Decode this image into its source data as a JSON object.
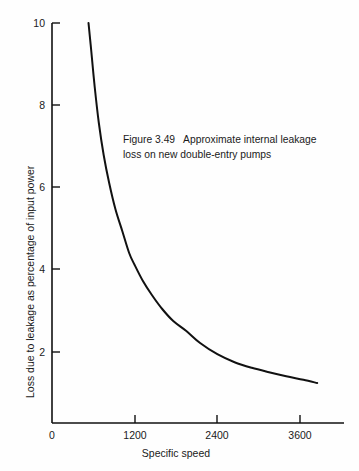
{
  "figure": {
    "caption_line1": "Figure 3.49   Approximate internal leakage",
    "caption_line2": "loss on new double-entry pumps",
    "background_color": "#fefefe",
    "ink_color": "#111111"
  },
  "chart_data": {
    "type": "line",
    "title": "Figure 3.49   Approximate internal leakage loss on new double-entry pumps",
    "xlabel": "Specific speed",
    "ylabel": "Loss due to leakage as percentage of input power",
    "xlim": [
      0,
      4000
    ],
    "ylim": [
      0,
      10
    ],
    "xticks": [
      0,
      1200,
      2400,
      3600
    ],
    "xtick_labels": [
      "0",
      "1200",
      "2400",
      "3600"
    ],
    "yticks": [
      2,
      4,
      6,
      8,
      10
    ],
    "ytick_labels": [
      "2",
      "4",
      "6",
      "8",
      "10"
    ],
    "grid": false,
    "legend": false,
    "series": [
      {
        "name": "Internal leakage loss",
        "color": "#111111",
        "line_width": 2.0,
        "x": [
          530,
          570,
          620,
          680,
          750,
          830,
          920,
          1020,
          1120,
          1200,
          1320,
          1450,
          1600,
          1760,
          1950,
          2150,
          2400,
          2650,
          2900,
          3150,
          3400,
          3650,
          3850
        ],
        "y": [
          10.0,
          9.3,
          8.4,
          7.5,
          6.7,
          6.0,
          5.35,
          4.8,
          4.25,
          3.95,
          3.55,
          3.2,
          2.85,
          2.55,
          2.3,
          2.0,
          1.72,
          1.52,
          1.38,
          1.27,
          1.17,
          1.08,
          1.0
        ]
      }
    ],
    "annotations": [
      {
        "text": "Figure 3.49   Approximate internal leakage loss on new double-entry pumps",
        "x": 1050,
        "y": 7.0
      }
    ]
  },
  "axes": {
    "y_ticks": [
      {
        "label": "10",
        "value": 10
      },
      {
        "label": "8",
        "value": 8
      },
      {
        "label": "6",
        "value": 6
      },
      {
        "label": "4",
        "value": 4
      },
      {
        "label": "2",
        "value": 2
      }
    ],
    "x_ticks": [
      {
        "label": "0",
        "value": 0
      },
      {
        "label": "1200",
        "value": 1200
      },
      {
        "label": "2400",
        "value": 2400
      },
      {
        "label": "3600",
        "value": 3600
      }
    ],
    "x_title": "Specific speed",
    "y_title": "Loss due to leakage as percentage of input power"
  }
}
